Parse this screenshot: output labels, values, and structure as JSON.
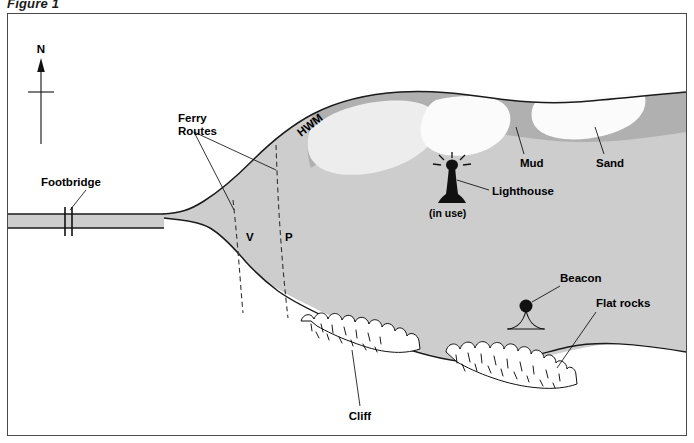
{
  "figure": {
    "caption": "Figure 1"
  },
  "colors": {
    "water": "#cdcdcd",
    "mud": "#b0b0b0",
    "sand": "#f2f2f2",
    "sand_bright": "#fbfbfb",
    "land": "#ffffff",
    "ink": "#1a1a1a",
    "frame": "#4a4a4a"
  },
  "compass": {
    "label": "N"
  },
  "labels": {
    "footbridge": "Footbridge",
    "ferry_routes_line1": "Ferry",
    "ferry_routes_line2": "Routes",
    "ferry_route_v": "V",
    "ferry_route_p": "P",
    "hwm": "HWM",
    "mud": "Mud",
    "sand": "Sand",
    "lighthouse": "Lighthouse",
    "lighthouse_status": "(in use)",
    "beacon": "Beacon",
    "flat_rocks": "Flat rocks",
    "cliff": "Cliff"
  },
  "map_data": {
    "type": "map",
    "title": "Figure 1",
    "features": [
      {
        "name": "Footbridge",
        "kind": "crossing"
      },
      {
        "name": "Ferry Routes",
        "kind": "route",
        "variants": [
          "V",
          "P"
        ]
      },
      {
        "name": "HWM",
        "kind": "line",
        "meaning": "High Water Mark"
      },
      {
        "name": "Mud",
        "kind": "substrate"
      },
      {
        "name": "Sand",
        "kind": "substrate"
      },
      {
        "name": "Lighthouse",
        "kind": "navigation",
        "status": "(in use)"
      },
      {
        "name": "Beacon",
        "kind": "navigation"
      },
      {
        "name": "Flat rocks",
        "kind": "shoreline"
      },
      {
        "name": "Cliff",
        "kind": "shoreline"
      }
    ]
  }
}
